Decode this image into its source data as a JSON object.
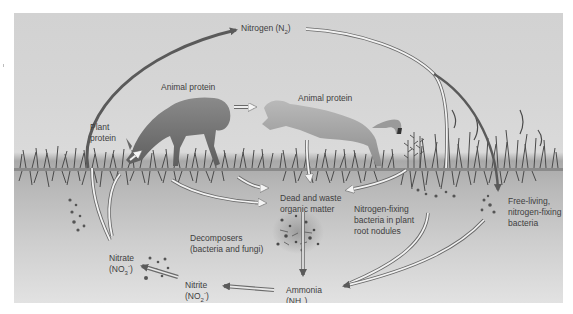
{
  "diagram": {
    "type": "nitrogen-cycle",
    "colors": {
      "sky": "#d4d4d4",
      "soil_top": "#a9a9a9",
      "soil_bottom": "#e2e2e2",
      "arrow_dark": "#5a5a5a",
      "arrow_light": "#f2f2f2",
      "text": "#3e3e3e"
    },
    "labels": {
      "nitrogen": {
        "text": "Nitrogen (N",
        "sub": "2",
        "end": ")"
      },
      "animal_protein_deer": "Animal protein",
      "animal_protein_cougar": "Animal protein",
      "plant_protein_line1": "Plant",
      "plant_protein_line2": "protein",
      "dead_waste_line1": "Dead and waste",
      "dead_waste_line2": "organic matter",
      "nfix_nodules_line1": "Nitrogen-fixing",
      "nfix_nodules_line2": "bacteria in plant",
      "nfix_nodules_line3": "root nodules",
      "free_living_line1": "Free-living,",
      "free_living_line2": "nitrogen-fixing",
      "free_living_line3": "bacteria",
      "decomposers_line1": "Decomposers",
      "decomposers_line2": "(bacteria and fungi)",
      "nitrate": {
        "name": "Nitrate",
        "formula": "(NO",
        "sub": "3",
        "sup": "-",
        "end": ")"
      },
      "nitrite": {
        "name": "Nitrite",
        "formula": "(NO",
        "sub": "2",
        "sup": "-",
        "end": ")"
      },
      "ammonia": {
        "name": "Ammonia",
        "formula": "(NH",
        "sub": "3",
        "end": ")"
      }
    },
    "flows": [
      {
        "from": "Plant protein",
        "to": "Nitrogen (N2)"
      },
      {
        "from": "Nitrogen (N2)",
        "to": "Nitrogen-fixing bacteria in plant root nodules"
      },
      {
        "from": "Nitrogen (N2)",
        "to": "Free-living, nitrogen-fixing bacteria"
      },
      {
        "from": "Animal protein (deer)",
        "to": "Animal protein (cougar)"
      },
      {
        "from": "Soil nitrate",
        "to": "Plant protein"
      },
      {
        "from": "Plant roots",
        "to": "Dead and waste organic matter"
      },
      {
        "from": "Animal protein (deer)",
        "to": "Dead and waste organic matter"
      },
      {
        "from": "Animal protein (cougar)",
        "to": "Dead and waste organic matter"
      },
      {
        "from": "Nitrogen-fixing bacteria in plant root nodules",
        "to": "Dead and waste organic matter"
      },
      {
        "from": "Dead and waste organic matter",
        "to": "Ammonia (NH3)"
      },
      {
        "from": "Nitrogen-fixing bacteria in plant root nodules",
        "to": "Ammonia (NH3)"
      },
      {
        "from": "Free-living, nitrogen-fixing bacteria",
        "to": "Ammonia (NH3)"
      },
      {
        "from": "Ammonia (NH3)",
        "to": "Nitrite (NO2-)"
      },
      {
        "from": "Nitrite (NO2-)",
        "to": "Nitrate (NO3-)"
      },
      {
        "from": "Nitrate (NO3-)",
        "to": "Plant protein"
      }
    ]
  }
}
